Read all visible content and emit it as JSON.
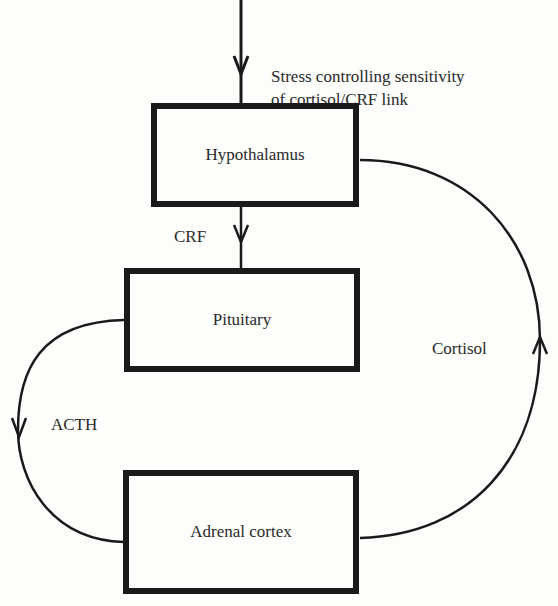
{
  "diagram": {
    "nodes": [
      {
        "id": "hypothalamus",
        "label": "Hypothalamus"
      },
      {
        "id": "pituitary",
        "label": "Pituitary"
      },
      {
        "id": "adrenal",
        "label": "Adrenal cortex"
      }
    ],
    "edges": [
      {
        "from": "input",
        "to": "hypothalamus",
        "label_line1": "Stress controlling sensitivity",
        "label_line2": "of cortisol/CRF link"
      },
      {
        "from": "hypothalamus",
        "to": "pituitary",
        "label": "CRF"
      },
      {
        "from": "pituitary",
        "to": "adrenal",
        "label": "ACTH"
      },
      {
        "from": "adrenal",
        "to": "hypothalamus",
        "label": "Cortisol"
      }
    ],
    "colors": {
      "line": "#1a1a1a",
      "background": "#fdfdfb"
    }
  }
}
